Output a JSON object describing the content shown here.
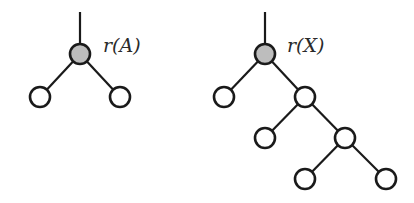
{
  "diagram": {
    "type": "tree",
    "colors": {
      "root_fill": "#bdbdbd",
      "node_fill": "#ffffff",
      "stroke": "#1a1a1a"
    },
    "trees": [
      {
        "name": "A",
        "root_label": "r(A)",
        "root": {
          "x": 80,
          "y": 54
        },
        "stem_top": {
          "x": 80,
          "y": 12
        },
        "label_pos": {
          "x": 103,
          "y": 52
        },
        "nodes": [
          {
            "id": "a0",
            "x": 80,
            "y": 54,
            "root": true
          },
          {
            "id": "a1",
            "x": 40,
            "y": 97
          },
          {
            "id": "a2",
            "x": 120,
            "y": 97
          }
        ],
        "edges": [
          [
            "a0",
            "a1"
          ],
          [
            "a0",
            "a2"
          ]
        ]
      },
      {
        "name": "X",
        "root_label": "r(X)",
        "root": {
          "x": 265,
          "y": 54
        },
        "stem_top": {
          "x": 265,
          "y": 12
        },
        "label_pos": {
          "x": 287,
          "y": 52
        },
        "nodes": [
          {
            "id": "x0",
            "x": 265,
            "y": 54,
            "root": true
          },
          {
            "id": "x1",
            "x": 224,
            "y": 97
          },
          {
            "id": "x2",
            "x": 305,
            "y": 97
          },
          {
            "id": "x3",
            "x": 265,
            "y": 138
          },
          {
            "id": "x4",
            "x": 345,
            "y": 138
          },
          {
            "id": "x5",
            "x": 305,
            "y": 179
          },
          {
            "id": "x6",
            "x": 386,
            "y": 179
          }
        ],
        "edges": [
          [
            "x0",
            "x1"
          ],
          [
            "x0",
            "x2"
          ],
          [
            "x2",
            "x3"
          ],
          [
            "x2",
            "x4"
          ],
          [
            "x4",
            "x5"
          ],
          [
            "x4",
            "x6"
          ]
        ]
      }
    ],
    "node_radius": 10
  }
}
